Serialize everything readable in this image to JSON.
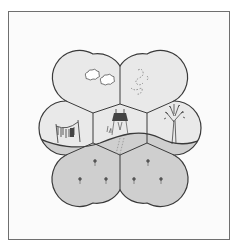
{
  "figure": {
    "cells": [
      {
        "id": "top-left",
        "content": "two clouds in the sky",
        "fill": "#e9e9e9"
      },
      {
        "id": "top-right",
        "content": "dotted footprint trail in the sky",
        "fill": "#e9e9e9"
      },
      {
        "id": "left",
        "content": "clothesline with hanging laundry",
        "fill": "#e9e9e9"
      },
      {
        "id": "center",
        "content": "house on stilts with footprints leading down",
        "fill": "#e9e9e9"
      },
      {
        "id": "right",
        "content": "leafy tree",
        "fill": "#e9e9e9"
      },
      {
        "id": "bottom-left",
        "content": "three small flowers in the ground",
        "fill": "#cfcfcf"
      },
      {
        "id": "bottom-right",
        "content": "three small flowers in the ground",
        "fill": "#cfcfcf"
      }
    ],
    "colors": {
      "frame_border": "#6f6f6f",
      "sky_fill": "#e9e9e9",
      "ground_fill": "#cfcfcf",
      "outline": "#3a3a3a",
      "house_roof": "#444444"
    }
  }
}
